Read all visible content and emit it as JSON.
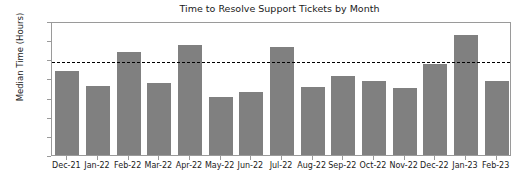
{
  "chart_data": {
    "type": "bar",
    "title": "Time to Resolve Support Tickets by Month",
    "xlabel": "",
    "ylabel": "Median Time (Hours)",
    "categories": [
      "Dec-21",
      "Jan-22",
      "Feb-22",
      "Mar-22",
      "Apr-22",
      "May-22",
      "Jun-22",
      "Jul-22",
      "Aug-22",
      "Sep-22",
      "Oct-22",
      "Nov-22",
      "Dec-22",
      "Jan-23",
      "Feb-23"
    ],
    "values": [
      11.0,
      9.0,
      13.5,
      9.4,
      14.4,
      7.6,
      8.2,
      14.1,
      8.9,
      10.3,
      9.7,
      8.7,
      11.9,
      15.7,
      9.7
    ],
    "ylim": [
      0.0,
      17.5
    ],
    "yticks": [
      0.0,
      2.5,
      5.0,
      7.5,
      10.0,
      12.5,
      15.0,
      17.5
    ],
    "ytick_labels": [
      "0.0",
      "2.5",
      "5.0",
      "7.5",
      "10.0",
      "12.5",
      "15.0",
      "17.5"
    ],
    "grid": false,
    "legend": null,
    "bar_color": "#808080",
    "annotations": [
      {
        "name": "threshold-line",
        "type": "hline",
        "value": 12.0,
        "style": "dashed",
        "color": "#000000"
      }
    ]
  }
}
